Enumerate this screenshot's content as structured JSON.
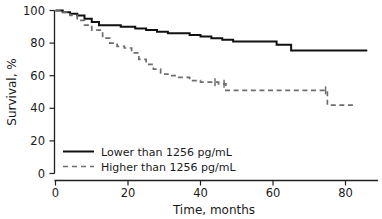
{
  "chart_data": {
    "type": "line",
    "title": "",
    "subtitle": "",
    "xlabel": "Time, months",
    "ylabel": "Survival, %",
    "xlim": [
      0,
      86
    ],
    "ylim": [
      0,
      100
    ],
    "xticks": [
      0,
      20,
      40,
      60,
      80
    ],
    "xtick_labels": [
      "0",
      "20",
      "40",
      "60",
      "80"
    ],
    "yticks": [
      0,
      20,
      40,
      60,
      80,
      100
    ],
    "ytick_labels": [
      "0",
      "20",
      "40",
      "60",
      "80",
      "100"
    ],
    "grid": false,
    "legend_position": "lower left",
    "step_style": "post",
    "series": [
      {
        "name": "Lower than 1256 pg/mL",
        "style": "solid",
        "color": "#111111",
        "x": [
          0,
          2,
          4,
          6,
          8,
          10,
          12,
          15,
          18,
          22,
          25,
          28,
          31,
          34,
          37,
          40,
          43,
          46,
          49,
          53,
          57,
          61,
          65,
          86
        ],
        "y": [
          100,
          99,
          98,
          97,
          95,
          93,
          91,
          91,
          90,
          89,
          88,
          87,
          86,
          86,
          85,
          84,
          83,
          82,
          81,
          81,
          81,
          79,
          75.5,
          75.5
        ]
      },
      {
        "name": "Higher than 1256 pg/mL",
        "style": "dashed",
        "color": "#6e6e6e",
        "x": [
          0,
          2,
          4,
          6,
          8,
          10,
          13,
          15,
          17,
          19,
          21,
          23,
          25,
          27,
          29,
          31,
          34,
          37,
          40,
          43,
          45,
          47,
          60,
          70,
          75,
          83
        ],
        "y": [
          100,
          99,
          97,
          94,
          91,
          88,
          83,
          80,
          78,
          77,
          74,
          70,
          67,
          64,
          61,
          60,
          59,
          57,
          56,
          56,
          55,
          51,
          51,
          51,
          42,
          42
        ]
      }
    ],
    "censor_marks": [
      {
        "series": "Higher than 1256 pg/mL",
        "x": 44,
        "y": 56
      },
      {
        "series": "Higher than 1256 pg/mL",
        "x": 46.5,
        "y": 55
      },
      {
        "series": "Higher than 1256 pg/mL",
        "x": 74.5,
        "y": 51
      }
    ]
  },
  "legend": {
    "entries": [
      {
        "label": "Lower than 1256 pg/mL",
        "style": "solid"
      },
      {
        "label": "Higher than 1256 pg/mL",
        "style": "dashed"
      }
    ]
  },
  "axes": {
    "x_title": "Time, months",
    "y_title": "Survival, %"
  }
}
